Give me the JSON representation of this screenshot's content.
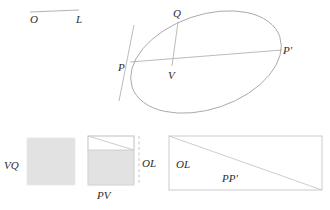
{
  "figure": {
    "background_color": "#ffffff",
    "stroke_color": "#a9a9a9",
    "label_color": "#2b2b2b",
    "fill_color": "#e2e2e2"
  },
  "segment_OL": {
    "label_O": "O",
    "label_L": "L"
  },
  "conic": {
    "label_P": "P",
    "label_P_prime": "P'",
    "label_Q": "Q",
    "label_V": "V"
  },
  "rect_vq": {
    "label": "VQ"
  },
  "rect_pv": {
    "label_bottom": "PV",
    "label_right": "OL"
  },
  "rect_ppprime": {
    "label_left": "OL",
    "label_diagonal": "PP'"
  }
}
